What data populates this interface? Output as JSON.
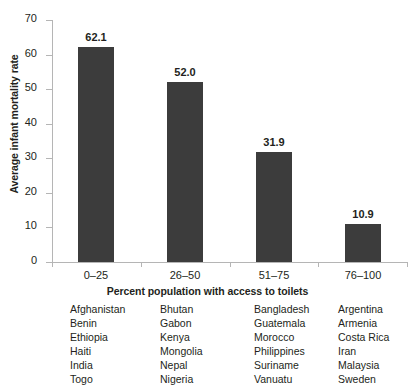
{
  "chart_data": {
    "type": "bar",
    "title": "",
    "xlabel": "Percent population with access to toilets",
    "ylabel": "Average infant mortality rate",
    "categories": [
      "0–25",
      "26–50",
      "51–75",
      "76–100"
    ],
    "values": [
      62.1,
      52.0,
      31.9,
      10.9
    ],
    "value_labels": [
      "62.1",
      "52.0",
      "31.9",
      "10.9"
    ],
    "ylim": [
      0,
      70
    ],
    "yticks": [
      0,
      10,
      20,
      30,
      40,
      50,
      60,
      70
    ],
    "ytick_labels": [
      "0",
      "10",
      "20",
      "30",
      "40",
      "50",
      "60",
      "70"
    ],
    "grid": false,
    "legend": false,
    "bar_color": "#3c3c3c",
    "axis_color": "#b5b5b5",
    "text_color": "#231f20"
  },
  "country_groups": [
    {
      "category": "0–25",
      "countries": [
        "Afghanistan",
        "Benin",
        "Ethiopia",
        "Haiti",
        "India",
        "Togo"
      ]
    },
    {
      "category": "26–50",
      "countries": [
        "Bhutan",
        "Gabon",
        "Kenya",
        "Mongolia",
        "Nepal",
        "Nigeria"
      ]
    },
    {
      "category": "51–75",
      "countries": [
        "Bangladesh",
        "Guatemala",
        "Morocco",
        "Philippines",
        "Suriname",
        "Vanuatu"
      ]
    },
    {
      "category": "76–100",
      "countries": [
        "Argentina",
        "Armenia",
        "Costa Rica",
        "Iran",
        "Malaysia",
        "Sweden"
      ]
    }
  ]
}
